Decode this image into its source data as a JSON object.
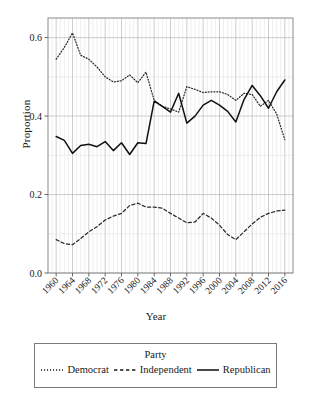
{
  "chart_data": {
    "type": "line",
    "title": "",
    "xlabel": "Year",
    "ylabel": "Proportion",
    "xlim": [
      1958,
      2018
    ],
    "ylim": [
      0.0,
      0.65
    ],
    "yticks": [
      0.0,
      0.2,
      0.4,
      0.6
    ],
    "ytick_labels": [
      "0.0",
      "0.2",
      "0.4",
      "0.6"
    ],
    "yminor": [
      0.1,
      0.3,
      0.5
    ],
    "grid": true,
    "legend_position": "bottom",
    "legend_title": "Party",
    "xticks": [
      1960,
      1964,
      1968,
      1972,
      1976,
      1980,
      1984,
      1988,
      1992,
      1996,
      2000,
      2004,
      2008,
      2012,
      2016
    ],
    "xtick_labels": [
      "1960",
      "1964",
      "1968",
      "1972",
      "1976",
      "1980",
      "1984",
      "1988",
      "1992",
      "1996",
      "2000",
      "2004",
      "2008",
      "2012",
      "2016"
    ],
    "x": [
      1960,
      1962,
      1964,
      1966,
      1968,
      1970,
      1972,
      1974,
      1976,
      1978,
      1980,
      1982,
      1984,
      1986,
      1988,
      1990,
      1992,
      1994,
      1996,
      1998,
      2000,
      2002,
      2004,
      2006,
      2008,
      2010,
      2012,
      2014,
      2016
    ],
    "series": [
      {
        "name": "Democrat",
        "style": "dotted",
        "color": "#2b2b2b",
        "values": [
          0.545,
          0.575,
          0.612,
          0.555,
          0.545,
          0.525,
          0.5,
          0.487,
          0.49,
          0.505,
          0.485,
          0.512,
          0.44,
          0.425,
          0.418,
          0.41,
          0.475,
          0.468,
          0.46,
          0.462,
          0.462,
          0.455,
          0.44,
          0.458,
          0.455,
          0.425,
          0.44,
          0.405,
          0.34
        ]
      },
      {
        "name": "Independent",
        "style": "dashed",
        "color": "#2b2b2b",
        "values": [
          0.085,
          0.075,
          0.072,
          0.088,
          0.105,
          0.118,
          0.135,
          0.145,
          0.152,
          0.172,
          0.178,
          0.168,
          0.168,
          0.165,
          0.152,
          0.14,
          0.128,
          0.13,
          0.152,
          0.14,
          0.122,
          0.098,
          0.085,
          0.105,
          0.125,
          0.142,
          0.152,
          0.158,
          0.16
        ]
      },
      {
        "name": "Republican",
        "style": "solid",
        "color": "#111111",
        "values": [
          0.348,
          0.338,
          0.305,
          0.325,
          0.328,
          0.322,
          0.335,
          0.312,
          0.332,
          0.302,
          0.332,
          0.33,
          0.438,
          0.425,
          0.41,
          0.458,
          0.382,
          0.4,
          0.428,
          0.44,
          0.428,
          0.412,
          0.385,
          0.442,
          0.478,
          0.452,
          0.42,
          0.462,
          0.492
        ]
      }
    ]
  },
  "axis": {
    "y_title": "Proportion",
    "x_title": "Year"
  },
  "legend": {
    "title": "Party",
    "items": [
      {
        "label": "Democrat",
        "style": "dotted"
      },
      {
        "label": "Independent",
        "style": "dashed"
      },
      {
        "label": "Republican",
        "style": "solid"
      }
    ]
  }
}
